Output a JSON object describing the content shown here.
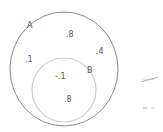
{
  "diagram": {
    "type": "venn",
    "colors": {
      "outer_circle": "#8c8c8c",
      "inner_circle": "#c8c8c8",
      "text": "#555555",
      "marks": "#9a9a9a"
    },
    "sets": [
      {
        "id": "A",
        "label": "A"
      },
      {
        "id": "B",
        "label": "B"
      }
    ],
    "region_labels": [
      {
        "id": "a-top",
        "text": ".8"
      },
      {
        "id": "a-left",
        "text": ".1"
      },
      {
        "id": "a-right",
        "text": ".4"
      },
      {
        "id": "b-upper",
        "text": "-.1"
      },
      {
        "id": "b-lower",
        "text": ".8"
      }
    ],
    "side_marks": [
      {
        "id": "mark-upper",
        "text": "="
      },
      {
        "id": "mark-lower",
        "text": "- ."
      }
    ]
  }
}
